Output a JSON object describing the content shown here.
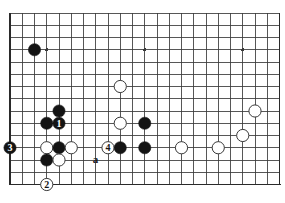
{
  "diagram": {
    "type": "go-board-diagram",
    "board": {
      "columns": 22,
      "rows": 14,
      "origin_x": 10,
      "origin_y": 13,
      "cell": 12.25,
      "line_color": "#3a3a3a",
      "border_color": "#2a2a2a",
      "board_color": "#ffffff",
      "border_width": 1.9,
      "line_width": 0.85,
      "edges": {
        "left": true,
        "bottom": true,
        "top": false,
        "right": true
      }
    },
    "star_points": [
      {
        "col": 3,
        "row": 3
      },
      {
        "col": 11,
        "row": 3
      },
      {
        "col": 19,
        "row": 3
      },
      {
        "col": 11,
        "row": 11
      }
    ],
    "stones": [
      {
        "id": "b-corner-top-left",
        "color": "black",
        "col": 2,
        "row": 3,
        "label": ""
      },
      {
        "id": "w-center-upper",
        "color": "white",
        "col": 9,
        "row": 6,
        "label": ""
      },
      {
        "id": "w-center-mid",
        "color": "white",
        "col": 9,
        "row": 9,
        "label": ""
      },
      {
        "id": "w-right-high",
        "color": "white",
        "col": 20,
        "row": 8,
        "label": ""
      },
      {
        "id": "w-right-mid",
        "color": "white",
        "col": 19,
        "row": 10,
        "label": ""
      },
      {
        "id": "w-right-low",
        "color": "white",
        "col": 17,
        "row": 11,
        "label": ""
      },
      {
        "id": "w-bottom-right",
        "color": "white",
        "col": 14,
        "row": 11,
        "label": ""
      },
      {
        "id": "b-up-top",
        "color": "black",
        "col": 4,
        "row": 8,
        "label": ""
      },
      {
        "id": "b-left-shoulder",
        "color": "black",
        "col": 3,
        "row": 9,
        "label": ""
      },
      {
        "id": "b-move-1",
        "color": "black",
        "col": 4,
        "row": 9,
        "label": "1"
      },
      {
        "id": "b-move-3",
        "color": "black",
        "col": 0,
        "row": 11,
        "label": "3"
      },
      {
        "id": "w-cut-left",
        "color": "white",
        "col": 3,
        "row": 11,
        "label": ""
      },
      {
        "id": "b-centerblock",
        "color": "black",
        "col": 4,
        "row": 11,
        "label": ""
      },
      {
        "id": "w-right-of-block",
        "color": "white",
        "col": 5,
        "row": 11,
        "label": ""
      },
      {
        "id": "b-below-left",
        "color": "black",
        "col": 3,
        "row": 12,
        "label": ""
      },
      {
        "id": "w-below-block",
        "color": "white",
        "col": 4,
        "row": 12,
        "label": ""
      },
      {
        "id": "w-move-2",
        "color": "white",
        "col": 3,
        "row": 14,
        "label": "2"
      },
      {
        "id": "w-move-4",
        "color": "white",
        "col": 8,
        "row": 11,
        "label": "4"
      },
      {
        "id": "b-bottom-a",
        "color": "black",
        "col": 9,
        "row": 11,
        "label": ""
      },
      {
        "id": "b-bottom-b",
        "color": "black",
        "col": 11,
        "row": 11,
        "label": ""
      },
      {
        "id": "b-mid-upper",
        "color": "black",
        "col": 11,
        "row": 9,
        "label": ""
      }
    ],
    "point_labels": [
      {
        "id": "point-a",
        "text": "a",
        "col": 7,
        "row": 12
      }
    ],
    "stone_style": {
      "radius": 6.1,
      "black_fill": "#141414",
      "black_stroke": "#141414",
      "white_fill": "#ffffff",
      "white_stroke": "#3a3a3a",
      "white_stroke_width": 1.0,
      "label_black_on_white_color": "#141414",
      "label_white_on_black_color": "#ffffff",
      "label_font_size": 10
    }
  }
}
